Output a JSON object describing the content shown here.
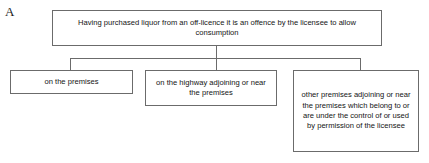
{
  "figure": {
    "panel_label": "A"
  },
  "nodes": {
    "root": {
      "text": "Having purchased liquor from an off-licence it is an offence by the licensee to allow consumption"
    },
    "branch_1": {
      "text": "on the premises"
    },
    "branch_2": {
      "text": "on the highway adjoining or near the premises"
    },
    "branch_3": {
      "text": "other premises adjoining or near the premises which belong to or are under the control of or used by permission of the licensee"
    }
  },
  "style": {
    "box_border_color": "#6b6b6b",
    "connector_color": "#6b6b6b",
    "text_color": "#141414",
    "background": "#ffffff"
  }
}
